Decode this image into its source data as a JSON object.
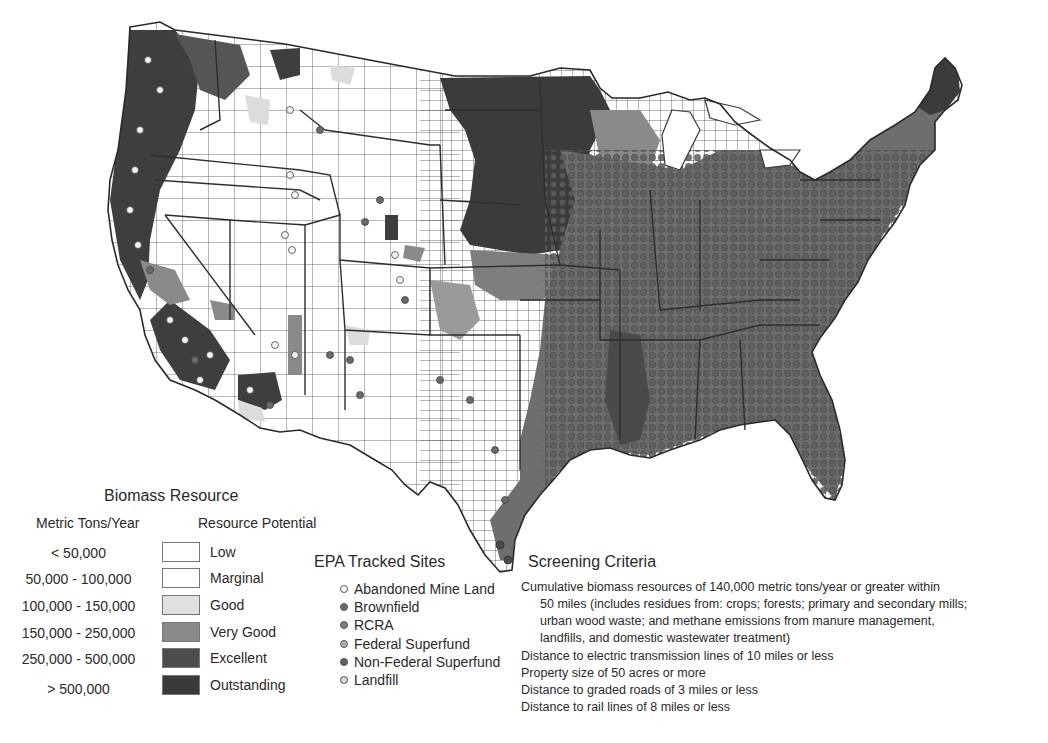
{
  "map": {
    "subject": "Contiguous United States county-level biomass resource map with EPA tracked sites",
    "colors": {
      "low": "#ffffff",
      "marginal": "#ffffff",
      "good": "#dcdcdc",
      "very_good": "#8e8e8e",
      "excellent": "#4a4a4a",
      "outstanding": "#3a3a3a",
      "border": "#3c3c3c",
      "site_dot_dark": "#5e5e5e",
      "site_dot_light": "#f2f2f2"
    }
  },
  "biomass_legend": {
    "title": "Biomass Resource",
    "col_tons": "Metric Tons/Year",
    "col_potential": "Resource Potential",
    "rows": [
      {
        "range": "< 50,000",
        "level": "Low",
        "color": "#ffffff"
      },
      {
        "range": "50,000 - 100,000",
        "level": "Marginal",
        "color": "#ffffff"
      },
      {
        "range": "100,000 - 150,000",
        "level": "Good",
        "color": "#e0e0e0"
      },
      {
        "range": "150,000 - 250,000",
        "level": "Very Good",
        "color": "#8a8a8a"
      },
      {
        "range": "250,000 - 500,000",
        "level": "Excellent",
        "color": "#4c4c4c"
      },
      {
        "range": "> 500,000",
        "level": "Outstanding",
        "color": "#3a3a3a"
      }
    ]
  },
  "epa_legend": {
    "title": "EPA Tracked Sites",
    "items": [
      {
        "label": "Abandoned Mine Land",
        "fill": "#ffffff",
        "stroke": "#555555"
      },
      {
        "label": "Brownfield",
        "fill": "#6a6a6a",
        "stroke": "#555555"
      },
      {
        "label": "RCRA",
        "fill": "#808080",
        "stroke": "#555555"
      },
      {
        "label": "Federal Superfund",
        "fill": "#b0b0b0",
        "stroke": "#555555"
      },
      {
        "label": "Non-Federal Superfund",
        "fill": "#606060",
        "stroke": "#555555"
      },
      {
        "label": "Landfill",
        "fill": "#d8d8d8",
        "stroke": "#555555"
      }
    ]
  },
  "screening_criteria": {
    "title": "Screening Criteria",
    "lines": [
      {
        "text": "Cumulative biomass resources of 140,000 metric tons/year or greater within",
        "indent": false
      },
      {
        "text": "50 miles (includes residues from: crops; forests; primary and secondary mills;",
        "indent": true
      },
      {
        "text": "urban wood waste; and methane emissions from manure management,",
        "indent": true
      },
      {
        "text": "landfills, and domestic wastewater treatment)",
        "indent": true
      },
      {
        "text": "Distance to electric transmission lines of 10 miles or less",
        "indent": false
      },
      {
        "text": "Property size of 50 acres or more",
        "indent": false
      },
      {
        "text": "Distance to graded roads of 3 miles or less",
        "indent": false
      },
      {
        "text": "Distance to rail lines of 8 miles or less",
        "indent": false
      }
    ]
  }
}
